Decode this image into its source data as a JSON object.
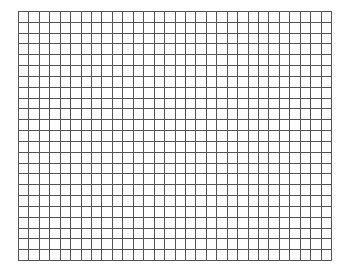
{
  "grid": {
    "columns": 30,
    "rows": 23,
    "left": 18,
    "top": 11,
    "width": 313,
    "height": 249,
    "line_color": "#555555",
    "line_width": 1,
    "background": "#ffffff"
  }
}
